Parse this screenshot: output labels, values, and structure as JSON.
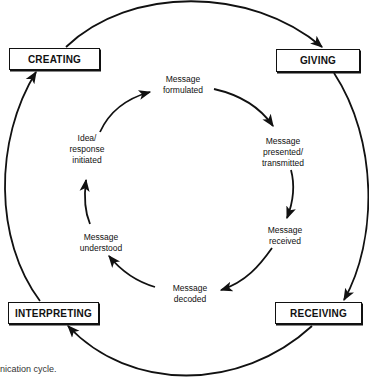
{
  "outer_stages": [
    {
      "label": "CREATING"
    },
    {
      "label": "GIVING"
    },
    {
      "label": "RECEIVING"
    },
    {
      "label": "INTERPRETING"
    }
  ],
  "inner_steps": [
    {
      "label": "Message\nformulated"
    },
    {
      "label": "Message\npresented/\ntransmitted"
    },
    {
      "label": "Message\nreceived"
    },
    {
      "label": "Message\ndecoded"
    },
    {
      "label": "Message\nunderstood"
    },
    {
      "label": "Idea/\nresponse\ninitiated"
    }
  ],
  "caption": "nication cycle.",
  "colors": {
    "line": "#111111",
    "background": "#ffffff"
  }
}
